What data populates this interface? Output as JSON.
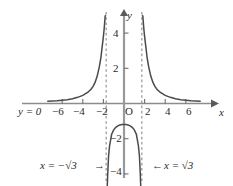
{
  "figure": {
    "title": "",
    "background_color": "#ffffff",
    "curve_color": "#4a4a4a",
    "axis_color": "#8c8c8c",
    "dashed_color": "#8c8c8c",
    "text_color": "#2b2b2b"
  },
  "axes": {
    "x_axis_label": "x",
    "y_axis_label": "y",
    "origin_label": "O",
    "x_ticks": [
      {
        "value": -6,
        "label": "−6"
      },
      {
        "value": -4,
        "label": "−4"
      },
      {
        "value": -2,
        "label": "−2"
      },
      {
        "value": 2,
        "label": "2"
      },
      {
        "value": 4,
        "label": "4"
      },
      {
        "value": 6,
        "label": "6"
      }
    ],
    "y_ticks": [
      {
        "value": 4,
        "label": "4"
      },
      {
        "value": 2,
        "label": "2"
      },
      {
        "value": -2,
        "label": "−2"
      },
      {
        "value": -4,
        "label": "−4"
      }
    ],
    "xlim": [
      -7.6,
      7.4
    ],
    "ylim": [
      -4.8,
      5.0
    ]
  },
  "annotations": {
    "horizontal_asymptote": "y = 0",
    "left_asymptote": "x = −√3",
    "left_asymptote_arrow": "→",
    "right_asymptote": "x = √3",
    "right_asymptote_arrow": "←"
  },
  "chart_data": {
    "type": "line",
    "title": "",
    "xlabel": "x",
    "ylabel": "y",
    "xlim": [
      -7.6,
      7.4
    ],
    "ylim": [
      -4.8,
      5.0
    ],
    "grid": false,
    "legend": null,
    "asymptotes": {
      "vertical": [
        -1.7320508,
        1.7320508
      ],
      "vertical_labels": [
        "x = −√3",
        "x = √3"
      ],
      "horizontal": [
        0
      ],
      "horizontal_labels": [
        "y = 0"
      ]
    },
    "series": [
      {
        "name": "left-branch",
        "style": "solid",
        "x": [
          -7.4,
          -7.0,
          -6.5,
          -6.0,
          -5.5,
          -5.0,
          -4.5,
          -4.0,
          -3.5,
          -3.2,
          -3.0,
          -2.8,
          -2.6,
          -2.4,
          -2.25,
          -2.1,
          -2.0,
          -1.95,
          -1.9,
          -1.86,
          -1.83,
          -1.8
        ],
        "y": [
          0.13,
          0.14,
          0.15,
          0.18,
          0.21,
          0.27,
          0.35,
          0.46,
          0.64,
          0.81,
          0.97,
          1.21,
          1.56,
          2.08,
          2.58,
          3.32,
          3.81,
          4.09,
          4.42,
          4.72,
          4.95,
          5.0
        ]
      },
      {
        "name": "middle-branch",
        "style": "solid",
        "x": [
          -1.63,
          -1.58,
          -1.5,
          -1.4,
          -1.2,
          -1.0,
          -0.8,
          -0.6,
          -0.4,
          -0.2,
          0.0,
          0.2,
          0.4,
          0.6,
          0.8,
          1.0,
          1.2,
          1.4,
          1.5,
          1.58,
          1.63
        ],
        "y": [
          -4.8,
          -4.0,
          -3.0,
          -2.4,
          -1.75,
          -1.5,
          -1.35,
          -1.27,
          -1.22,
          -1.2,
          -1.2,
          -1.2,
          -1.22,
          -1.27,
          -1.35,
          -1.5,
          -1.75,
          -2.4,
          -3.0,
          -4.0,
          -4.8
        ]
      },
      {
        "name": "right-branch",
        "style": "solid",
        "x": [
          1.8,
          1.83,
          1.86,
          1.9,
          1.95,
          2.0,
          2.1,
          2.25,
          2.4,
          2.6,
          2.8,
          3.0,
          3.2,
          3.5,
          4.0,
          4.5,
          5.0,
          5.5,
          6.0,
          6.5,
          7.0,
          7.4
        ],
        "y": [
          5.0,
          4.95,
          4.72,
          4.42,
          4.09,
          3.81,
          3.32,
          2.58,
          2.08,
          1.56,
          1.21,
          0.97,
          0.81,
          0.64,
          0.46,
          0.35,
          0.27,
          0.21,
          0.18,
          0.15,
          0.14,
          0.13
        ]
      }
    ]
  }
}
